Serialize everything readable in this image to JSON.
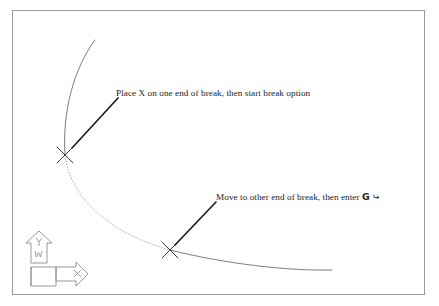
{
  "figure": {
    "background_color": "#ffffff",
    "border": {
      "color": "#9a9a9a",
      "x": 12,
      "y": 10,
      "width": 413,
      "height": 285
    },
    "ink_color": "#2b2b2b",
    "geometry_color": "#6f6f6f",
    "dashed_color": "#a9a9a9"
  },
  "annotations": [
    {
      "id": "place-x",
      "text": "Place X on one end of break, then start break option",
      "leader": {
        "from_x": 118,
        "from_y": 98,
        "to_x": 72,
        "to_y": 148
      }
    },
    {
      "id": "move-other-end",
      "text_before_key": "Move to other end of break, then enter",
      "key_label": "G",
      "enter_symbol": "↵",
      "leader": {
        "from_x": 216,
        "from_y": 202,
        "to_x": 175,
        "to_y": 245
      }
    }
  ],
  "markers": [
    {
      "id": "break-start-x",
      "label": "X",
      "x": 65,
      "y": 155
    },
    {
      "id": "break-end-x",
      "label": "X",
      "x": 170,
      "y": 250
    }
  ],
  "arc": {
    "solid_upper": "M 95,40 C 74,68 62,112 65,155",
    "dashed_break": "M 65,155 C 70,196 106,232 170,250",
    "solid_lower": "M 170,250 C 226,264 288,271 332,270"
  },
  "ucs_icon": {
    "name": "ucs-icon",
    "axis_y_label": "Y",
    "axis_x_label": "X",
    "world_label": "W",
    "color": "#8d8d8d"
  }
}
